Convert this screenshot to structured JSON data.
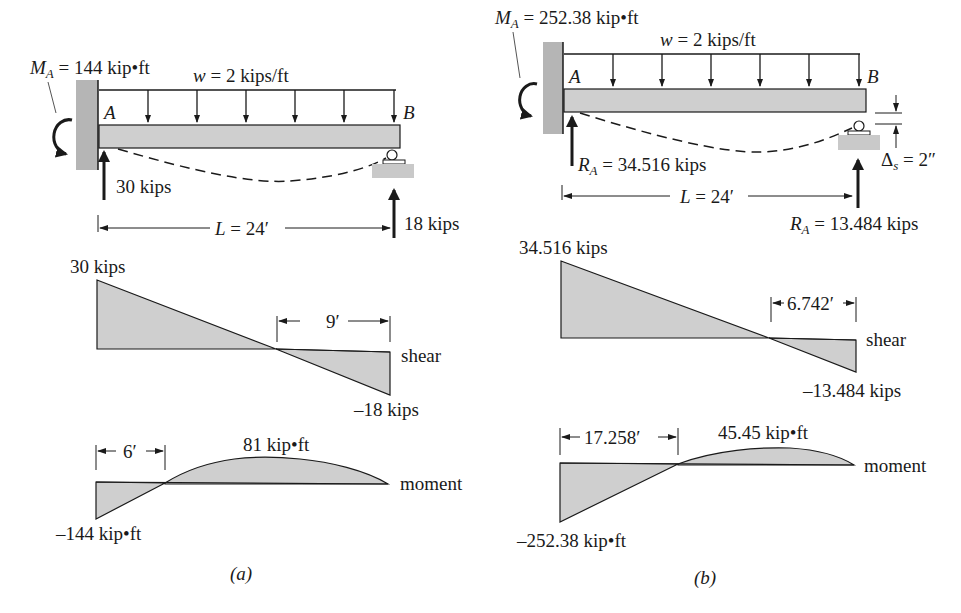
{
  "panel_a": {
    "caption": "(a)",
    "moment_label_symbol": "M",
    "moment_label_sub": "A",
    "moment_label_value": " = 144 kip•ft",
    "load_label_symbol": "w",
    "load_label_value": " = 2 kips/ft",
    "point_a": "A",
    "point_b": "B",
    "reaction_a": "30 kips",
    "reaction_b": "18 kips",
    "span_symbol": "L",
    "span_value": " = 24′",
    "shear_max": "30 kips",
    "shear_min": "–18 kips",
    "shear_dim": "9′",
    "shear_name": "shear",
    "moment_max": "81 kip•ft",
    "moment_min": "–144 kip•ft",
    "moment_dim": "6′",
    "moment_name": "moment"
  },
  "panel_b": {
    "caption": "(b)",
    "moment_label_symbol": "M",
    "moment_label_sub": "A",
    "moment_label_value": " = 252.38 kip•ft",
    "load_label_symbol": "w",
    "load_label_value": " = 2 kips/ft",
    "point_a": "A",
    "point_b": "B",
    "reaction_a_symbol": "R",
    "reaction_a_sub": "A",
    "reaction_a_value": " = 34.516 kips",
    "reaction_b_symbol": "R",
    "reaction_b_sub": "A",
    "reaction_b_value": " = 13.484 kips",
    "settlement_symbol": "Δ",
    "settlement_sub": "s",
    "settlement_value": " = 2″",
    "span_symbol": "L",
    "span_value": " = 24′",
    "shear_max": "34.516 kips",
    "shear_min": "–13.484 kips",
    "shear_dim": "6.742′",
    "shear_name": "shear",
    "moment_max": "45.45 kip•ft",
    "moment_min": "–252.38 kip•ft",
    "moment_dim": "17.258′",
    "moment_name": "moment"
  },
  "colors": {
    "fill": "#cfcfcf",
    "wall": "#b5b5b5",
    "line": "#1a1a1a"
  }
}
